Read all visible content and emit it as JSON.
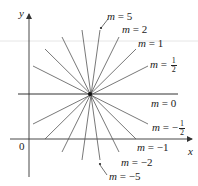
{
  "axes": {
    "x_label": "x",
    "y_label": "y",
    "origin_label": "0"
  },
  "labels": {
    "m5": {
      "var": "m",
      "eq": " = ",
      "val": "5"
    },
    "m2": {
      "var": "m",
      "eq": " = ",
      "val": "2"
    },
    "m1": {
      "var": "m",
      "eq": " = ",
      "val": "1"
    },
    "mhalf": {
      "var": "m",
      "eq": " = ",
      "num": "1",
      "den": "2"
    },
    "m0": {
      "var": "m",
      "eq": " = ",
      "val": "0"
    },
    "mneghalf": {
      "var": "m",
      "eq": " = −",
      "num": "1",
      "den": "2"
    },
    "mneg1": {
      "var": "m",
      "eq": " = ",
      "val": "−1"
    },
    "mneg2": {
      "var": "m",
      "eq": " = ",
      "val": "−2"
    },
    "mneg5": {
      "var": "m",
      "eq": " = ",
      "val": "−5"
    }
  },
  "colors": {
    "line": "#555555",
    "axis": "#333333",
    "text": "#222222",
    "center": "#111111"
  },
  "pencil": {
    "center": [
      90,
      94
    ],
    "slopes": [
      "5",
      "2",
      "1",
      "1/2",
      "0",
      "-1/2",
      "-1",
      "-2",
      "-5"
    ],
    "endpoints_upper": [
      [
        100,
        30
      ],
      [
        119,
        37
      ],
      [
        136,
        49
      ],
      [
        148,
        66
      ],
      [
        178,
        94
      ]
    ],
    "endpoints_left_upper": [
      [
        82,
        30
      ],
      [
        62,
        37
      ],
      [
        45,
        49
      ],
      [
        33,
        66
      ],
      [
        18,
        94
      ]
    ],
    "endpoints_lower": [
      [
        100,
        160
      ],
      [
        119,
        152
      ],
      [
        136,
        139
      ],
      [
        148,
        124
      ]
    ],
    "endpoints_left_lower": [
      [
        82,
        160
      ],
      [
        62,
        152
      ],
      [
        45,
        139
      ],
      [
        33,
        124
      ]
    ]
  }
}
